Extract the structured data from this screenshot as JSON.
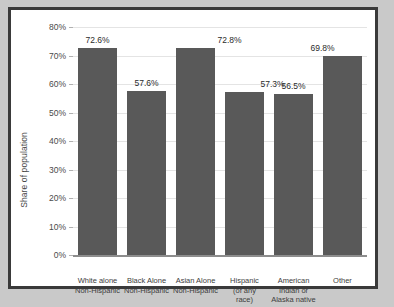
{
  "chart_data": {
    "type": "bar",
    "title": "",
    "xlabel": "",
    "ylabel": "Share of population",
    "ylim": [
      0,
      80
    ],
    "grid": true,
    "legend": false,
    "y_tick_labels": [
      "80%",
      "70%",
      "60%",
      "50%",
      "40%",
      "30%",
      "20%",
      "10%",
      "0%"
    ],
    "y_tick_values": [
      80,
      70,
      60,
      50,
      40,
      30,
      20,
      10,
      0
    ],
    "categories": [
      "White alone\nNon-Hispanic",
      "Black Alone\nNon-Hispanic",
      "Asian Alone\nNon-Hispanic",
      "Hispanic\n(of any\nrace)",
      "American\nIndian or\nAlaska native",
      "Other"
    ],
    "values": [
      72.6,
      57.6,
      72.8,
      57.3,
      56.5,
      69.8
    ],
    "value_labels": [
      "72.6%",
      "57.6%",
      "72.8%",
      "57.3%",
      "56.5%",
      "69.8%"
    ],
    "bar_color": "#595959",
    "gridline_color": "#e4e4e4",
    "axis_color": "#8d8d8d",
    "plot_background": "#ffffff",
    "frame_color": "#3a3a3a",
    "page_background": "#c9c9c9"
  }
}
